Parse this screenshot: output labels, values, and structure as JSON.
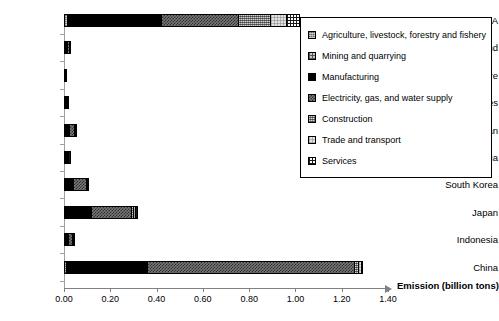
{
  "chart_data": {
    "type": "bar",
    "orientation": "horizontal",
    "stacked": true,
    "title": "",
    "xlabel": "Emission (billion tons)",
    "ylabel": "",
    "xlim": [
      0.0,
      1.4
    ],
    "xticks": [
      "0.00",
      "0.20",
      "0.40",
      "0.60",
      "0.80",
      "1.00",
      "1.20",
      "1.40"
    ],
    "xtick_values": [
      0.0,
      0.2,
      0.4,
      0.6,
      0.8,
      1.0,
      1.2,
      1.4
    ],
    "grid": false,
    "legend_position": "right-inside",
    "categories": [
      "USA",
      "Thailand",
      "Singapore",
      "Philippines",
      "Taiwan",
      "Malaysia",
      "South Korea",
      "Japan",
      "Indonesia",
      "China"
    ],
    "series": [
      {
        "name": "Agriculture, livestock, forestry and fishery",
        "pattern": "agriculture",
        "color": "#9a9a9a",
        "values": [
          0.012,
          0.001,
          0.0,
          0.001,
          0.001,
          0.001,
          0.002,
          0.004,
          0.002,
          0.008
        ]
      },
      {
        "name": "Mining and quarrying",
        "pattern": "mining",
        "color": "#c8c8c8",
        "values": [
          0.004,
          0.0,
          0.0,
          0.0,
          0.0,
          0.0,
          0.001,
          0.002,
          0.001,
          0.004
        ]
      },
      {
        "name": "Manufacturing",
        "pattern": "manufacturing",
        "color": "#000000",
        "values": [
          0.405,
          0.012,
          0.004,
          0.008,
          0.02,
          0.01,
          0.035,
          0.112,
          0.014,
          0.345
        ]
      },
      {
        "name": "Electricity, gas, and water supply",
        "pattern": "electricity",
        "color": "#777777",
        "values": [
          0.33,
          0.007,
          0.002,
          0.003,
          0.022,
          0.006,
          0.055,
          0.17,
          0.018,
          0.895
        ]
      },
      {
        "name": "Construction",
        "pattern": "construction",
        "color": "#8d8d8d",
        "values": [
          0.14,
          0.001,
          0.0,
          0.001,
          0.002,
          0.001,
          0.003,
          0.008,
          0.001,
          0.018
        ]
      },
      {
        "name": "Trade and transport",
        "pattern": "trade",
        "color": "#e2e2e2",
        "values": [
          0.07,
          0.001,
          0.0,
          0.001,
          0.001,
          0.001,
          0.002,
          0.01,
          0.001,
          0.012
        ]
      },
      {
        "name": "Services",
        "pattern": "services",
        "color": "#ffffff",
        "values": [
          0.06,
          0.001,
          0.0,
          0.001,
          0.001,
          0.001,
          0.002,
          0.012,
          0.001,
          0.01
        ]
      }
    ],
    "totals": [
      1.021,
      0.023,
      0.006,
      0.015,
      0.047,
      0.02,
      0.1,
      0.318,
      0.038,
      1.292
    ]
  },
  "legend": {
    "items": [
      {
        "label": "Agriculture, livestock, forestry and fishery",
        "pattern": "agriculture"
      },
      {
        "label": "Mining and quarrying",
        "pattern": "mining"
      },
      {
        "label": "Manufacturing",
        "pattern": "manufacturing"
      },
      {
        "label": "Electricity, gas, and water supply",
        "pattern": "electricity"
      },
      {
        "label": "Construction",
        "pattern": "construction"
      },
      {
        "label": "Trade and transport",
        "pattern": "trade"
      },
      {
        "label": "Services",
        "pattern": "services"
      }
    ]
  },
  "axis": {
    "x_title": "Emission (billion tons)"
  }
}
